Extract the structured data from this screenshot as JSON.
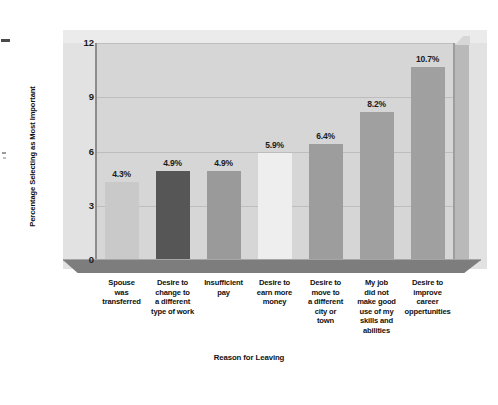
{
  "chart_data": {
    "type": "bar",
    "title": "",
    "xlabel": "Reason for Leaving",
    "ylabel": "Percentage Selecting as Most Important",
    "ylim": [
      0,
      12
    ],
    "yticks": [
      "0",
      "3",
      "6",
      "9",
      "12"
    ],
    "grid": true,
    "legend": "none",
    "categories": [
      "Spouse was transferred",
      "Desire to change to a different type of work",
      "Insufficient pay",
      "Desire to earn more money",
      "Desire to move to a different city or town",
      "My job did not make good use of my skills and abilities",
      "Desire to improve career oppertunities"
    ],
    "category_lines": [
      [
        "Spouse",
        "was",
        "transferred"
      ],
      [
        "Desire to",
        "change to",
        "a different",
        "type of work"
      ],
      [
        "Insufficient",
        "pay"
      ],
      [
        "Desire to",
        "earn more",
        "money"
      ],
      [
        "Desire to",
        "move to",
        "a different",
        "city or",
        "town"
      ],
      [
        "My job",
        "did not",
        "make good",
        "use of my",
        "skills and",
        "abilities"
      ],
      [
        "Desire to",
        "improve",
        "career",
        "oppertunities"
      ]
    ],
    "values": [
      4.3,
      4.9,
      4.9,
      5.9,
      6.4,
      8.2,
      10.7
    ],
    "value_labels": [
      "4.3%",
      "4.9%",
      "4.9%",
      "5.9%",
      "6.4%",
      "8.2%",
      "10.7%"
    ],
    "bar_colors": [
      "#c9c9c9",
      "#565656",
      "#9a9a9a",
      "#eeeeee",
      "#9d9d9d",
      "#a0a0a0",
      "#a0a0a0"
    ]
  },
  "palette": {
    "page_background": "#ffffff",
    "back_wall": "#e2e2e2",
    "plot_panel": "#d6d6d6",
    "gridline": "#bdbdbd",
    "axis_line": "#8c8c8c",
    "floor": "#7d7d7d",
    "side_wall": "#b9b9b9",
    "text": "#111111"
  }
}
